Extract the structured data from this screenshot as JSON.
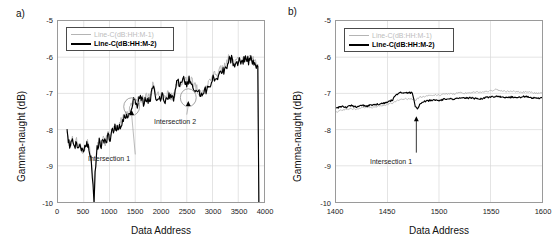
{
  "figure": {
    "panels": [
      {
        "label": "a)",
        "ylabel": "Gamma-naught (dB)",
        "xlabel": "Data Address",
        "legend": [
          {
            "name": "Line-C(dB:HH:M-1)",
            "color": "#b4b4b4"
          },
          {
            "name": "Line-C(dB:HH:M-2)",
            "color": "#000000"
          }
        ],
        "annotations": [
          {
            "text": "Intersection 1"
          },
          {
            "text": "Intersection 2"
          }
        ]
      },
      {
        "label": "b)",
        "ylabel": "Gamma-naught (dB)",
        "xlabel": "Data Address",
        "legend": [
          {
            "name": "Line-C(dB:HH:M-1)",
            "color": "#b4b4b4"
          },
          {
            "name": "Line-C(dB:HH:M-2)",
            "color": "#000000"
          }
        ],
        "annotations": [
          {
            "text": "Intersection 1"
          }
        ]
      }
    ]
  },
  "chart_data": [
    {
      "type": "line",
      "title": "a)",
      "xlabel": "Data Address",
      "ylabel": "Gamma-naught (dB)",
      "xlim": [
        0,
        4000
      ],
      "ylim": [
        -10,
        -5
      ],
      "xticks": [
        0,
        500,
        1000,
        1500,
        2000,
        2500,
        3000,
        3500,
        4000
      ],
      "yticks": [
        -5,
        -6,
        -7,
        -8,
        -9,
        -10
      ],
      "grid": true,
      "legend_position": "upper-left",
      "annotations": [
        {
          "text": "Intersection 1",
          "x": 1500,
          "y": -8.85,
          "points_to_x": 1430,
          "points_to_y": -7.45,
          "marker": "ellipse"
        },
        {
          "text": "Intersection 2",
          "x": 2500,
          "y": -7.75,
          "points_to_x": 2530,
          "points_to_y": -7.2,
          "marker": "ellipse"
        }
      ],
      "series": [
        {
          "name": "Line-C(dB:HH:M-1)",
          "color": "#b4b4b4",
          "x": [
            175,
            200,
            240,
            280,
            320,
            360,
            400,
            440,
            480,
            520,
            560,
            600,
            640,
            680,
            700,
            720,
            760,
            800,
            840,
            880,
            920,
            960,
            1000,
            1060,
            1120,
            1180,
            1240,
            1300,
            1360,
            1420,
            1480,
            1540,
            1600,
            1660,
            1720,
            1780,
            1840,
            1900,
            1960,
            2020,
            2080,
            2140,
            2200,
            2260,
            2320,
            2380,
            2440,
            2500,
            2560,
            2620,
            2680,
            2740,
            2800,
            2860,
            2920,
            2980,
            3040,
            3100,
            3160,
            3220,
            3280,
            3340,
            3400,
            3460,
            3520,
            3580,
            3640,
            3700,
            3760,
            3820,
            3880,
            3900
          ],
          "y": [
            -8.05,
            -8.3,
            -8.45,
            -8.2,
            -8.5,
            -8.3,
            -8.55,
            -8.38,
            -8.6,
            -8.45,
            -8.35,
            -8.5,
            -8.75,
            -9.4,
            -10.0,
            -9.2,
            -8.5,
            -8.3,
            -8.45,
            -8.2,
            -8.35,
            -8.15,
            -8.2,
            -8.0,
            -7.85,
            -7.95,
            -7.7,
            -7.55,
            -7.6,
            -7.3,
            -7.15,
            -7.25,
            -7.1,
            -7.2,
            -7.05,
            -7.15,
            -6.75,
            -7.0,
            -7.1,
            -7.05,
            -7.15,
            -7.0,
            -7.1,
            -7.05,
            -6.6,
            -6.75,
            -6.6,
            -6.7,
            -6.55,
            -6.7,
            -6.85,
            -6.95,
            -7.0,
            -6.9,
            -6.7,
            -6.6,
            -6.5,
            -6.45,
            -6.35,
            -6.3,
            -6.15,
            -5.95,
            -6.1,
            -6.2,
            -6.05,
            -6.15,
            -5.95,
            -6.1,
            -6.0,
            -6.15,
            -6.2,
            -10.0
          ]
        },
        {
          "name": "Line-C(dB:HH:M-2)",
          "color": "#000000",
          "x": [
            175,
            200,
            240,
            280,
            320,
            360,
            400,
            440,
            480,
            520,
            560,
            600,
            640,
            680,
            700,
            720,
            760,
            800,
            840,
            880,
            920,
            960,
            1000,
            1060,
            1120,
            1180,
            1240,
            1300,
            1360,
            1420,
            1480,
            1540,
            1600,
            1660,
            1720,
            1780,
            1840,
            1900,
            1960,
            2020,
            2080,
            2140,
            2200,
            2260,
            2320,
            2380,
            2440,
            2500,
            2560,
            2620,
            2680,
            2740,
            2800,
            2860,
            2920,
            2980,
            3040,
            3100,
            3160,
            3220,
            3280,
            3340,
            3400,
            3460,
            3520,
            3580,
            3640,
            3700,
            3760,
            3820,
            3880,
            3900
          ],
          "y": [
            -8.05,
            -8.35,
            -8.5,
            -8.25,
            -8.55,
            -8.35,
            -8.6,
            -8.42,
            -8.65,
            -8.5,
            -8.4,
            -8.55,
            -8.8,
            -9.45,
            -10.0,
            -9.25,
            -8.55,
            -8.35,
            -8.5,
            -8.25,
            -8.4,
            -8.2,
            -8.25,
            -8.05,
            -7.9,
            -8.0,
            -7.75,
            -7.6,
            -7.65,
            -7.35,
            -7.2,
            -7.3,
            -7.15,
            -7.25,
            -7.1,
            -7.2,
            -6.8,
            -7.05,
            -7.15,
            -7.1,
            -7.2,
            -7.05,
            -7.15,
            -7.1,
            -6.65,
            -6.8,
            -6.65,
            -6.75,
            -6.6,
            -6.75,
            -6.9,
            -7.0,
            -7.05,
            -6.95,
            -6.75,
            -6.65,
            -6.55,
            -6.5,
            -6.4,
            -6.35,
            -6.2,
            -6.0,
            -6.15,
            -6.25,
            -6.1,
            -6.2,
            -6.0,
            -6.15,
            -6.05,
            -6.2,
            -6.25,
            -10.0
          ]
        }
      ]
    },
    {
      "type": "line",
      "title": "b)",
      "xlabel": "Data Address",
      "ylabel": "Gamma-naught (dB)",
      "xlim": [
        1400,
        1600
      ],
      "ylim": [
        -10,
        -5
      ],
      "xticks": [
        1400,
        1450,
        1500,
        1550,
        1600
      ],
      "yticks": [
        -5,
        -6,
        -7,
        -8,
        -9,
        -10
      ],
      "grid": true,
      "legend_position": "upper-left",
      "annotations": [
        {
          "text": "Intersection 1",
          "x": 1478,
          "y": -8.8,
          "points_to_x": 1478,
          "points_to_y": -7.62,
          "marker": "arrow"
        }
      ],
      "series": [
        {
          "name": "Line-C(dB:HH:M-1)",
          "color": "#b4b4b4",
          "x": [
            1400,
            1405,
            1410,
            1415,
            1420,
            1425,
            1430,
            1435,
            1440,
            1445,
            1450,
            1455,
            1458,
            1462,
            1466,
            1470,
            1474,
            1477,
            1479,
            1482,
            1486,
            1490,
            1495,
            1500,
            1505,
            1510,
            1515,
            1520,
            1525,
            1530,
            1535,
            1540,
            1545,
            1550,
            1555,
            1560,
            1565,
            1570,
            1575,
            1580,
            1585,
            1590,
            1595,
            1600
          ],
          "y": [
            -7.52,
            -7.46,
            -7.44,
            -7.42,
            -7.44,
            -7.4,
            -7.38,
            -7.4,
            -7.36,
            -7.33,
            -7.3,
            -7.26,
            -7.22,
            -7.18,
            -7.16,
            -7.15,
            -7.16,
            -7.2,
            -7.15,
            -7.1,
            -7.08,
            -7.06,
            -7.04,
            -7.05,
            -7.02,
            -7.0,
            -7.02,
            -6.98,
            -7.0,
            -6.98,
            -6.96,
            -6.97,
            -6.95,
            -6.93,
            -6.9,
            -6.92,
            -6.95,
            -6.93,
            -6.95,
            -6.97,
            -6.95,
            -6.98,
            -7.0,
            -6.98
          ]
        },
        {
          "name": "Line-C(dB:HH:M-2)",
          "color": "#000000",
          "x": [
            1400,
            1405,
            1410,
            1415,
            1420,
            1425,
            1430,
            1435,
            1440,
            1445,
            1450,
            1455,
            1458,
            1462,
            1466,
            1470,
            1474,
            1477,
            1479,
            1482,
            1486,
            1490,
            1495,
            1500,
            1505,
            1510,
            1515,
            1520,
            1525,
            1530,
            1535,
            1540,
            1545,
            1550,
            1555,
            1560,
            1565,
            1570,
            1575,
            1580,
            1585,
            1590,
            1595,
            1600
          ],
          "y": [
            -7.42,
            -7.36,
            -7.38,
            -7.34,
            -7.37,
            -7.33,
            -7.35,
            -7.32,
            -7.3,
            -7.28,
            -7.24,
            -7.18,
            -7.05,
            -6.98,
            -7.0,
            -6.97,
            -6.99,
            -7.35,
            -7.42,
            -7.28,
            -7.22,
            -7.2,
            -7.18,
            -7.2,
            -7.16,
            -7.14,
            -7.16,
            -7.12,
            -7.14,
            -7.12,
            -7.14,
            -7.15,
            -7.12,
            -7.1,
            -7.08,
            -7.1,
            -7.12,
            -7.1,
            -7.12,
            -7.1,
            -7.08,
            -7.12,
            -7.14,
            -7.12
          ]
        }
      ]
    }
  ]
}
